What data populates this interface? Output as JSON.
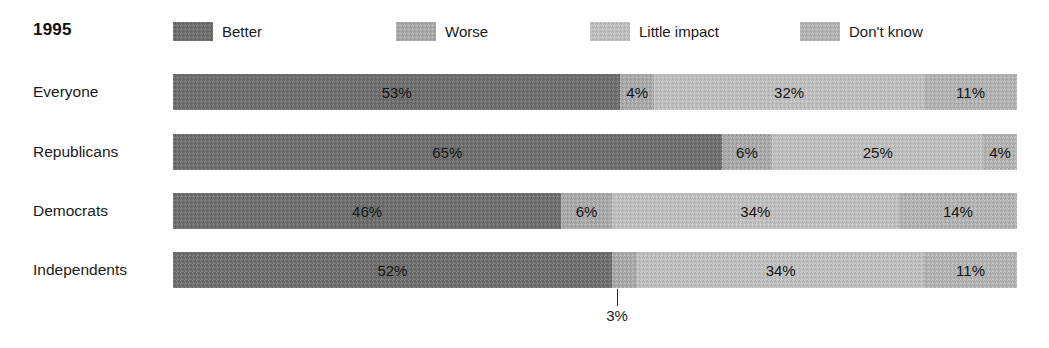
{
  "header": {
    "year": "1995"
  },
  "legend": {
    "items": [
      {
        "label": "Better",
        "color": "#6e6e6e",
        "swatch_class": "sw-better",
        "x": 173
      },
      {
        "label": "Worse",
        "color": "#a9a9a9",
        "swatch_class": "sw-worse",
        "x": 396
      },
      {
        "label": "Little impact",
        "color": "#bebebe",
        "swatch_class": "sw-little",
        "x": 590
      },
      {
        "label": "Don't know",
        "color": "#b2b2b2",
        "swatch_class": "sw-dontknow",
        "x": 800
      }
    ]
  },
  "chart_data": {
    "type": "bar",
    "title": "1995",
    "orientation": "horizontal",
    "stacked": true,
    "stack_total": 100,
    "xlabel": "",
    "ylabel": "",
    "xlim": [
      0,
      100
    ],
    "grid": false,
    "legend_position": "top",
    "categories": [
      "Everyone",
      "Republicans",
      "Democrats",
      "Independents"
    ],
    "series": [
      {
        "name": "Better",
        "color": "#6e6e6e",
        "values": [
          53,
          65,
          46,
          52
        ]
      },
      {
        "name": "Worse",
        "color": "#a9a9a9",
        "values": [
          4,
          6,
          6,
          3
        ]
      },
      {
        "name": "Little impact",
        "color": "#bebebe",
        "values": [
          32,
          25,
          34,
          34
        ]
      },
      {
        "name": "Don't know",
        "color": "#b2b2b2",
        "values": [
          11,
          4,
          14,
          11
        ]
      }
    ],
    "data_labels": [
      [
        "53%",
        "4%",
        "32%",
        "11%"
      ],
      [
        "65%",
        "6%",
        "25%",
        "4%"
      ],
      [
        "46%",
        "6%",
        "34%",
        "14%"
      ],
      [
        "52%",
        "3%",
        "34%",
        "11%"
      ]
    ],
    "annotations": [
      {
        "text": "3%",
        "series": "Worse",
        "category": "Independents",
        "value": 3,
        "leader_line": true
      }
    ]
  },
  "rows": [
    {
      "label": "Everyone",
      "top": 74,
      "segments": [
        {
          "series": "Better",
          "value": 53,
          "label": "53%",
          "swatch_class": "sw-better",
          "label_hidden": false
        },
        {
          "series": "Worse",
          "value": 4,
          "label": "4%",
          "swatch_class": "sw-worse",
          "label_hidden": false
        },
        {
          "series": "Little impact",
          "value": 32,
          "label": "32%",
          "swatch_class": "sw-little",
          "label_hidden": false
        },
        {
          "series": "Don't know",
          "value": 11,
          "label": "11%",
          "swatch_class": "sw-dontknow",
          "label_hidden": false
        }
      ]
    },
    {
      "label": "Republicans",
      "top": 134,
      "segments": [
        {
          "series": "Better",
          "value": 65,
          "label": "65%",
          "swatch_class": "sw-better",
          "label_hidden": false
        },
        {
          "series": "Worse",
          "value": 6,
          "label": "6%",
          "swatch_class": "sw-worse",
          "label_hidden": false
        },
        {
          "series": "Little impact",
          "value": 25,
          "label": "25%",
          "swatch_class": "sw-little",
          "label_hidden": false
        },
        {
          "series": "Don't know",
          "value": 4,
          "label": "4%",
          "swatch_class": "sw-dontknow",
          "label_hidden": false
        }
      ]
    },
    {
      "label": "Democrats",
      "top": 193,
      "segments": [
        {
          "series": "Better",
          "value": 46,
          "label": "46%",
          "swatch_class": "sw-better",
          "label_hidden": false
        },
        {
          "series": "Worse",
          "value": 6,
          "label": "6%",
          "swatch_class": "sw-worse",
          "label_hidden": false
        },
        {
          "series": "Little impact",
          "value": 34,
          "label": "34%",
          "swatch_class": "sw-little",
          "label_hidden": false
        },
        {
          "series": "Don't know",
          "value": 14,
          "label": "14%",
          "swatch_class": "sw-dontknow",
          "label_hidden": false
        }
      ]
    },
    {
      "label": "Independents",
      "top": 252,
      "segments": [
        {
          "series": "Better",
          "value": 52,
          "label": "52%",
          "swatch_class": "sw-better",
          "label_hidden": false
        },
        {
          "series": "Worse",
          "value": 3,
          "label": "3%",
          "swatch_class": "sw-worse",
          "label_hidden": true
        },
        {
          "series": "Little impact",
          "value": 34,
          "label": "34%",
          "swatch_class": "sw-little",
          "label_hidden": false
        },
        {
          "series": "Don't know",
          "value": 11,
          "label": "11%",
          "swatch_class": "sw-dontknow",
          "label_hidden": false
        }
      ]
    }
  ],
  "callout": {
    "text": "3%",
    "x": 617,
    "line_top": 289,
    "line_height": 17,
    "text_top": 307
  },
  "geometry": {
    "bar_left": 173,
    "bar_width": 844,
    "bar_height": 36
  }
}
